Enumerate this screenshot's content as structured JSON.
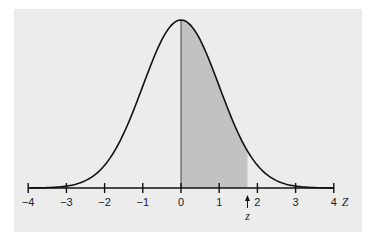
{
  "chart_data": {
    "type": "area",
    "title": "",
    "xlabel": "Z",
    "ylabel": "",
    "xlim": [
      -4,
      4
    ],
    "x_ticks": [
      -4,
      -3,
      -2,
      -1,
      0,
      1,
      2,
      3,
      4
    ],
    "x_tick_labels": [
      "−4",
      "−3",
      "−2",
      "−1",
      "0",
      "1",
      "2",
      "3",
      "4"
    ],
    "curve": "standard normal pdf",
    "shaded_region": {
      "from": 0,
      "to": 1.74
    },
    "annotations": [
      {
        "label": "z",
        "x": 1.74,
        "type": "arrow"
      }
    ],
    "grid": false,
    "legend": null
  },
  "colors": {
    "panel": "#ececec",
    "shade": "#c2c2c2",
    "curve": "#111111"
  }
}
